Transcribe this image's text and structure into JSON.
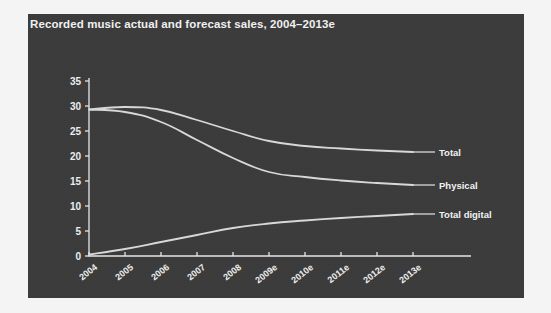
{
  "figure": {
    "title": "Recorded music actual and forecast sales, 2004–2013e",
    "panel_color": "#3b3b3b",
    "outer_color": "#f4f4f4",
    "line_color": "#d8d8d8",
    "axis_color": "#e6e6e6",
    "text_color": "#ededed"
  },
  "chart_data": {
    "type": "line",
    "title": "Recorded music actual and forecast sales, 2004–2013e",
    "xlabel": "",
    "ylabel": "",
    "categories": [
      "2004",
      "2005",
      "2006",
      "2007",
      "2008",
      "2009e",
      "2010e",
      "2011e",
      "2012e",
      "2013e"
    ],
    "ylim": [
      0,
      35
    ],
    "yticks": [
      0,
      5,
      10,
      15,
      20,
      25,
      30,
      35
    ],
    "ytick_labels": [
      "0",
      "5",
      "10",
      "15",
      "20",
      "25",
      "30",
      "35"
    ],
    "grid": false,
    "legend_position": "right-inline",
    "series": [
      {
        "name": "Total",
        "values": [
          29.3,
          29.8,
          29.2,
          27.2,
          25.0,
          23.0,
          22.0,
          21.5,
          21.1,
          20.8
        ]
      },
      {
        "name": "Physical",
        "values": [
          29.3,
          28.8,
          26.8,
          23.2,
          19.6,
          16.8,
          15.8,
          15.1,
          14.6,
          14.2
        ]
      },
      {
        "name": "Total digital",
        "values": [
          0.3,
          1.4,
          2.8,
          4.2,
          5.6,
          6.5,
          7.1,
          7.6,
          8.0,
          8.4
        ]
      }
    ]
  }
}
